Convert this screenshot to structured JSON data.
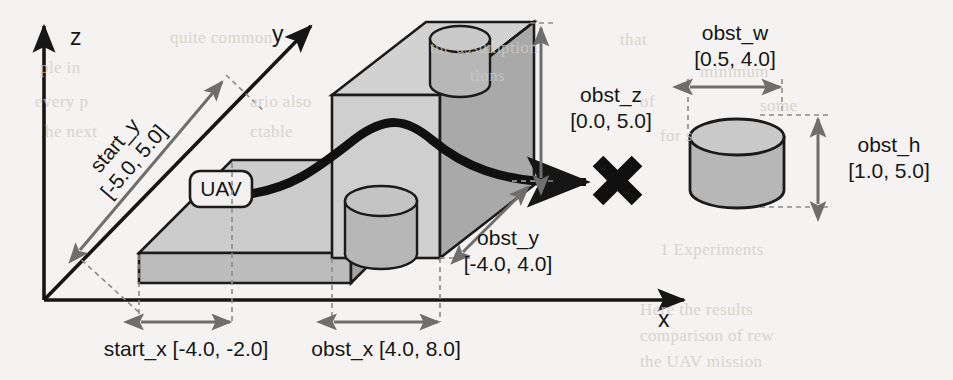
{
  "figure": {
    "background_color": "#f4f3f1"
  },
  "axes": {
    "x_label": "x",
    "y_label": "y",
    "z_label": "z",
    "axis_color": "#161616"
  },
  "markers": {
    "uav_label": "UAV",
    "target_marker": "X"
  },
  "colors": {
    "box_top": "#d2d2d2",
    "box_front": "#cccccc",
    "box_side": "#a9a9a9",
    "cylinder_fill": "#b7b7b7",
    "dimension_arrow": "#6e6e6e",
    "dashed_guide": "#8a8a8a",
    "path": "#101010"
  },
  "dimensions": [
    {
      "id": "start_y",
      "name": "start_y",
      "range": "[-5.0, 5.0]",
      "text": "start_y\n[-5.0, 5.0]",
      "orientation": "diagonal"
    },
    {
      "id": "start_x",
      "name": "start_x",
      "range": "[-4.0, -2.0]",
      "text": "start_x [-4.0, -2.0]",
      "orientation": "horizontal"
    },
    {
      "id": "obst_x",
      "name": "obst_x",
      "range": "[4.0, 8.0]",
      "text": "obst_x [4.0, 8.0]",
      "orientation": "horizontal"
    },
    {
      "id": "obst_y",
      "name": "obst_y",
      "range": "[-4.0, 4.0]",
      "line1": "obst_y",
      "line2": "[-4.0, 4.0]",
      "orientation": "diagonal"
    },
    {
      "id": "obst_z",
      "name": "obst_z",
      "range": "[0.0, 5.0]",
      "line1": "obst_z",
      "line2": "[0.0, 5.0]",
      "orientation": "vertical"
    },
    {
      "id": "obst_w",
      "name": "obst_w",
      "range": "[0.5, 4.0]",
      "line1": "obst_w",
      "line2": "[0.5, 4.0]",
      "orientation": "horizontal"
    },
    {
      "id": "obst_h",
      "name": "obst_h",
      "range": "[1.0, 5.0]",
      "line1": "obst_h",
      "line2": "[1.0, 5.0]",
      "orientation": "vertical"
    }
  ],
  "bleed_through_text": [
    {
      "text": "quite common",
      "x": 170,
      "y": 28
    },
    {
      "text": "the assumption",
      "x": 430,
      "y": 38
    },
    {
      "text": "that",
      "x": 620,
      "y": 30
    },
    {
      "text": "ple in",
      "x": 40,
      "y": 58
    },
    {
      "text": "tions",
      "x": 470,
      "y": 66
    },
    {
      "text": "minimum",
      "x": 700,
      "y": 62
    },
    {
      "text": "every p",
      "x": 35,
      "y": 92
    },
    {
      "text": "ario also",
      "x": 250,
      "y": 92
    },
    {
      "text": "of",
      "x": 640,
      "y": 92
    },
    {
      "text": "some",
      "x": 760,
      "y": 96
    },
    {
      "text": "he next",
      "x": 45,
      "y": 122
    },
    {
      "text": "ctable",
      "x": 250,
      "y": 122
    },
    {
      "text": "for s",
      "x": 660,
      "y": 126
    },
    {
      "text": "1  Experiments",
      "x": 660,
      "y": 240
    },
    {
      "text": "Here the results",
      "x": 640,
      "y": 300
    },
    {
      "text": "comparison of rew",
      "x": 640,
      "y": 326
    },
    {
      "text": "the UAV mission",
      "x": 640,
      "y": 352
    }
  ]
}
